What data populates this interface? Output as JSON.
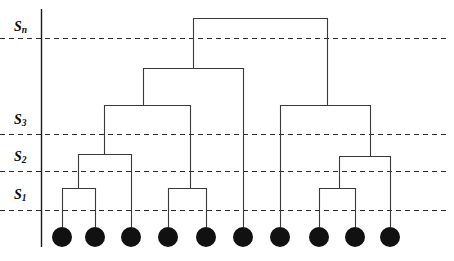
{
  "figure": {
    "type": "dendrogram",
    "width": 454,
    "height": 261,
    "background_color": "#ffffff",
    "line_color": "#3a3a3a",
    "axis_color": "#1a1a1a",
    "threshold_line_color": "#2b2b2b",
    "leaf_color": "#111111"
  },
  "axis": {
    "name": "similarity-axis",
    "x": 41,
    "y_top": 9,
    "y_bottom": 247,
    "labels": [
      {
        "id": "s-n",
        "base": "S",
        "subscript": "n",
        "text": "Sn",
        "x": 14,
        "y": 20,
        "threshold_y": 38
      },
      {
        "id": "s-3",
        "base": "S",
        "subscript": "3",
        "text": "S3",
        "x": 14,
        "y": 113,
        "threshold_y": 134
      },
      {
        "id": "s-2",
        "base": "S",
        "subscript": "2",
        "text": "S2",
        "x": 14,
        "y": 150,
        "threshold_y": 171
      },
      {
        "id": "s-1",
        "base": "S",
        "subscript": "1",
        "text": "S1",
        "x": 14,
        "y": 188,
        "threshold_y": 210
      }
    ]
  },
  "thresholds": [
    {
      "id": "threshold-sn",
      "label": "Sn",
      "y": 38,
      "x_start": 0,
      "x_end": 447
    },
    {
      "id": "threshold-s3",
      "label": "S3",
      "y": 134,
      "x_start": 0,
      "x_end": 447
    },
    {
      "id": "threshold-s2",
      "label": "S2",
      "y": 171,
      "x_start": 0,
      "x_end": 447
    },
    {
      "id": "threshold-s1",
      "label": "S1",
      "y": 210,
      "x_start": 0,
      "x_end": 447
    }
  ],
  "leaves": [
    {
      "id": "leaf-1",
      "index": 1,
      "cx": 62,
      "cy": 237,
      "r": 10
    },
    {
      "id": "leaf-2",
      "index": 2,
      "cx": 95,
      "cy": 237,
      "r": 10
    },
    {
      "id": "leaf-3",
      "index": 3,
      "cx": 131,
      "cy": 237,
      "r": 10
    },
    {
      "id": "leaf-4",
      "index": 4,
      "cx": 168,
      "cy": 237,
      "r": 10
    },
    {
      "id": "leaf-5",
      "index": 5,
      "cx": 206,
      "cy": 237,
      "r": 10
    },
    {
      "id": "leaf-6",
      "index": 6,
      "cx": 243,
      "cy": 237,
      "r": 10
    },
    {
      "id": "leaf-7",
      "index": 7,
      "cx": 280,
      "cy": 237,
      "r": 10
    },
    {
      "id": "leaf-8",
      "index": 8,
      "cx": 319,
      "cy": 237,
      "r": 10
    },
    {
      "id": "leaf-9",
      "index": 9,
      "cx": 355,
      "cy": 237,
      "r": 10
    },
    {
      "id": "leaf-10",
      "index": 10,
      "cx": 390,
      "cy": 237,
      "r": 10
    }
  ],
  "merges": [
    {
      "id": "merge-a",
      "name": "merge-leaf1-leaf2",
      "y": 188,
      "x_left": 62,
      "x_right": 95,
      "x_parent": 78
    },
    {
      "id": "merge-b",
      "name": "merge-a-leaf3",
      "y": 154,
      "x_left": 78,
      "x_right": 131,
      "x_parent": 104
    },
    {
      "id": "merge-c",
      "name": "merge-leaf4-leaf5",
      "y": 188,
      "x_left": 168,
      "x_right": 206,
      "x_parent": 190
    },
    {
      "id": "merge-d",
      "name": "merge-b-c",
      "y": 105,
      "x_left": 104,
      "x_right": 190,
      "x_parent": 143
    },
    {
      "id": "merge-e",
      "name": "merge-d-leaf6",
      "y": 68,
      "x_left": 143,
      "x_right": 243,
      "x_parent": 193
    },
    {
      "id": "merge-f",
      "name": "merge-leaf8-leaf9",
      "y": 188,
      "x_left": 319,
      "x_right": 355,
      "x_parent": 339
    },
    {
      "id": "merge-g",
      "name": "merge-f-leaf10",
      "y": 156,
      "x_left": 339,
      "x_right": 390,
      "x_parent": 370
    },
    {
      "id": "merge-h",
      "name": "merge-leaf7-g",
      "y": 105,
      "x_left": 280,
      "x_right": 370,
      "x_parent": 327
    },
    {
      "id": "merge-root",
      "name": "merge-root",
      "y": 18,
      "x_left": 193,
      "x_right": 327,
      "x_parent": 260
    }
  ],
  "stems": [
    {
      "id": "stem-leaf1",
      "x": 62,
      "y_from": 227,
      "y_to": 188
    },
    {
      "id": "stem-leaf2",
      "x": 95,
      "y_from": 227,
      "y_to": 188
    },
    {
      "id": "stem-leaf3",
      "x": 131,
      "y_from": 227,
      "y_to": 154
    },
    {
      "id": "stem-leaf4",
      "x": 168,
      "y_from": 227,
      "y_to": 188
    },
    {
      "id": "stem-leaf5",
      "x": 206,
      "y_from": 227,
      "y_to": 188
    },
    {
      "id": "stem-leaf6",
      "x": 243,
      "y_from": 227,
      "y_to": 68
    },
    {
      "id": "stem-leaf7",
      "x": 280,
      "y_from": 227,
      "y_to": 105
    },
    {
      "id": "stem-leaf8",
      "x": 319,
      "y_from": 227,
      "y_to": 188
    },
    {
      "id": "stem-leaf9",
      "x": 355,
      "y_from": 227,
      "y_to": 188
    },
    {
      "id": "stem-leaf10",
      "x": 390,
      "y_from": 227,
      "y_to": 156
    },
    {
      "id": "stem-merge-a",
      "x": 78,
      "y_from": 188,
      "y_to": 154
    },
    {
      "id": "stem-merge-b",
      "x": 104,
      "y_from": 154,
      "y_to": 105
    },
    {
      "id": "stem-merge-c",
      "x": 190,
      "y_from": 188,
      "y_to": 105
    },
    {
      "id": "stem-merge-d",
      "x": 143,
      "y_from": 105,
      "y_to": 68
    },
    {
      "id": "stem-merge-e",
      "x": 193,
      "y_from": 68,
      "y_to": 18
    },
    {
      "id": "stem-merge-f",
      "x": 339,
      "y_from": 188,
      "y_to": 156
    },
    {
      "id": "stem-merge-g",
      "x": 370,
      "y_from": 156,
      "y_to": 105
    },
    {
      "id": "stem-merge-h",
      "x": 327,
      "y_from": 105,
      "y_to": 18
    }
  ]
}
